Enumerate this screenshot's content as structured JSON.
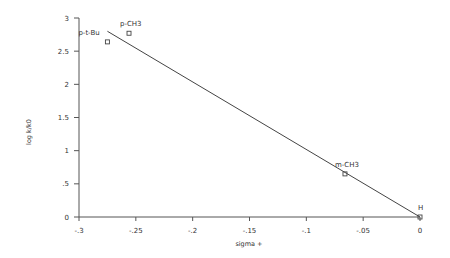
{
  "chart_data": {
    "type": "scatter",
    "title": "",
    "xlabel": "sigma +",
    "ylabel": "log k/k0",
    "xlim": [
      -0.3,
      0
    ],
    "ylim": [
      0,
      3
    ],
    "grid": false,
    "legend": null,
    "x_ticks": [
      -0.3,
      -0.25,
      -0.2,
      -0.15,
      -0.1,
      -0.05,
      0
    ],
    "x_tick_labels": [
      "-.3",
      "-.25",
      "-.2",
      "-.15",
      "-.1",
      "-.05",
      "0"
    ],
    "y_ticks": [
      0,
      0.5,
      1,
      1.5,
      2,
      2.5,
      3
    ],
    "y_tick_labels": [
      "0",
      ".5",
      "1",
      "1.5",
      "2",
      "2.5",
      "3"
    ],
    "points": [
      {
        "label": "p-t-Bu",
        "x": -0.275,
        "y": 2.64
      },
      {
        "label": "p-CH3",
        "x": -0.256,
        "y": 2.77
      },
      {
        "label": "m-CH3",
        "x": -0.066,
        "y": 0.65
      },
      {
        "label": "H",
        "x": 0,
        "y": 0
      }
    ],
    "fit_line": {
      "x": [
        -0.275,
        0
      ],
      "y": [
        2.8,
        0
      ],
      "slope": -10.2,
      "intercept": 0
    }
  }
}
